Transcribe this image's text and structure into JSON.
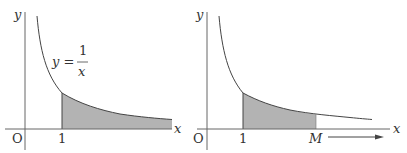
{
  "figure": {
    "colors": {
      "axis": "#555555",
      "curve": "#444444",
      "shade": "#b3b3b3"
    },
    "left": {
      "y_axis_label": "y",
      "x_axis_label": "x",
      "origin_label": "O",
      "tick_label_1": "1",
      "equation": {
        "lhs": "y =",
        "numerator": "1",
        "denominator": "x"
      }
    },
    "right": {
      "y_axis_label": "y",
      "x_axis_label": "x",
      "origin_label": "O",
      "tick_label_1": "1",
      "tick_label_m": "M",
      "arrow": "right-arrow"
    }
  }
}
